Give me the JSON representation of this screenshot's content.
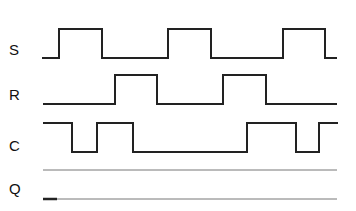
{
  "diagram": {
    "title": "",
    "type": "timing-diagram",
    "signals": [
      {
        "name": "S",
        "label_y": 51,
        "high_y": 29,
        "low_y": 58,
        "start_x": 42,
        "end_x": 337,
        "initial": "low",
        "transitions_x": [
          59,
          102,
          168,
          211,
          283,
          325
        ]
      },
      {
        "name": "R",
        "label_y": 96,
        "high_y": 75,
        "low_y": 104,
        "start_x": 43,
        "end_x": 337,
        "initial": "low",
        "transitions_x": [
          115,
          157,
          223,
          266
        ]
      },
      {
        "name": "C",
        "label_y": 147,
        "high_y": 123,
        "low_y": 152,
        "start_x": 43,
        "end_x": 338,
        "initial": "high",
        "transitions_x": [
          72,
          97,
          133,
          247,
          296,
          319
        ]
      },
      {
        "name": "Q",
        "label_y": 190,
        "high_y": 170,
        "low_y": 199,
        "start_x": 43,
        "end_x": 337,
        "initial": "low",
        "initial_segment_end_x": 57,
        "note": "blank to be filled in; guide lines only"
      }
    ],
    "colors": {
      "line": "#222222",
      "guide": "#777777",
      "background": "#ffffff"
    }
  }
}
